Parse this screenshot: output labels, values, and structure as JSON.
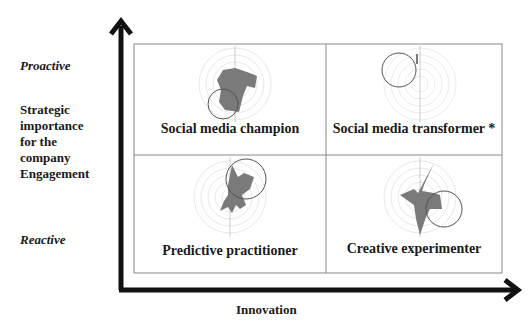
{
  "y_axis": {
    "top_label": "Proactive",
    "title": "Strategic importance for the company Engagement",
    "title_lines": [
      "Strategic",
      "importance",
      "for the",
      "company",
      "Engagement"
    ],
    "bottom_label": "Reactive"
  },
  "x_axis": {
    "title": "Innovation"
  },
  "quadrants": [
    {
      "position": "top-left",
      "title": "Social media champion",
      "highlight": "lower-left"
    },
    {
      "position": "top-right",
      "title": "Social media transformer *",
      "highlight": "upper-left"
    },
    {
      "position": "bottom-left",
      "title": "Predictive practitioner",
      "highlight": "upper-right"
    },
    {
      "position": "bottom-right",
      "title": "Creative experimenter",
      "highlight": "lower-right"
    }
  ],
  "radar_axes": [
    "1",
    "2",
    "3",
    "4",
    "5",
    "6",
    "7",
    "8",
    "9",
    "10",
    "11",
    "12",
    "13",
    "14",
    "15",
    "16"
  ],
  "colors": {
    "fill": "#7a7a7a",
    "grid": "#c8c8c8",
    "circle": "#555555",
    "axis": "#111111",
    "border": "#888888"
  }
}
